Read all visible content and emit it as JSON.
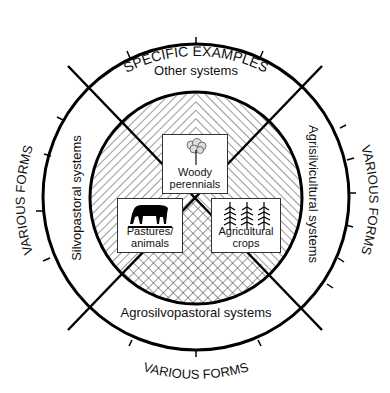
{
  "diagram": {
    "type": "agroforestry classification wheel",
    "outer_ring": {
      "top_label": "SPECIFIC EXAMPLES",
      "left_label": "VARIOUS FORMS",
      "right_label": "VARIOUS FORMS",
      "bottom_label": "VARIOUS FORMS"
    },
    "middle_ring": {
      "top": "Other systems",
      "left": "Silvopastoral systems",
      "right": "Agrisilvicultural systems",
      "bottom": "Agrosilvopastoral systems"
    },
    "core_components": [
      {
        "label_line1": "Woody",
        "label_line2": "perennials",
        "icon": "tree-icon"
      },
      {
        "label_line1": "Pastures/",
        "label_line2": "animals",
        "icon": "cow-icon"
      },
      {
        "label_line1": "Agricultural",
        "label_line2": "crops",
        "icon": "crop-plants-icon"
      }
    ],
    "colors": {
      "line": "#000000",
      "background": "#ffffff",
      "text": "#111111"
    }
  }
}
